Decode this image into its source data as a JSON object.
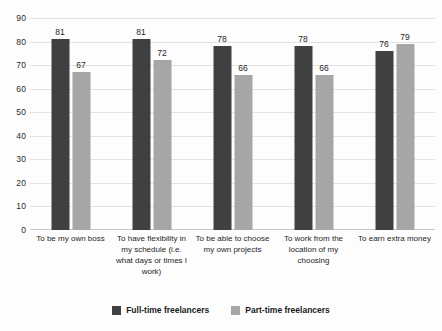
{
  "chart_data": {
    "type": "bar",
    "title": "",
    "subtitle": "",
    "xlabel": "",
    "ylabel": "",
    "ylim": [
      0,
      90
    ],
    "ytick_step": 10,
    "yticks": [
      "90",
      "80",
      "70",
      "60",
      "50",
      "40",
      "30",
      "20",
      "10",
      "0"
    ],
    "grid": true,
    "legend_position": "bottom",
    "categories": [
      "To be my own boss",
      "To have flexibility in my schedule (i.e. what days or times I work)",
      "To be able to choose my own projects",
      "To work from the location of my choosing",
      "To earn extra money"
    ],
    "series": [
      {
        "name": "Full-time freelancers",
        "color": "#404040",
        "values": [
          81,
          81,
          78,
          78,
          76
        ]
      },
      {
        "name": "Part-time freelancers",
        "color": "#a6a6a6",
        "values": [
          67,
          72,
          66,
          66,
          79
        ]
      }
    ]
  },
  "legend": {
    "items": [
      {
        "label": "Full-time freelancers",
        "color": "#404040"
      },
      {
        "label": "Part-time freelancers",
        "color": "#a6a6a6"
      }
    ]
  }
}
